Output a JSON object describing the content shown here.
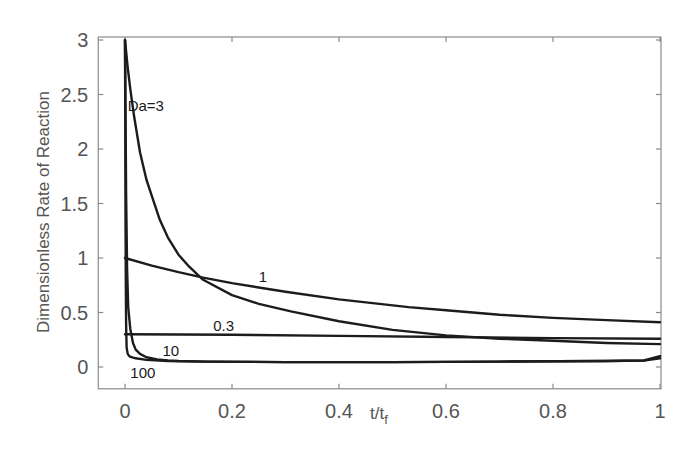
{
  "chart_data": {
    "type": "line",
    "title": "",
    "xlabel": "t/t_f",
    "xlabel_main": "t/t",
    "xlabel_sub": "f",
    "ylabel": "Dimensionless Rate of Reaction",
    "xlim": [
      -0.05,
      1
    ],
    "ylim": [
      -0.2,
      3
    ],
    "grid": false,
    "legend": "none (inline curve labels)",
    "xticks": [
      0,
      0.2,
      0.4,
      0.6,
      0.8,
      1
    ],
    "xtick_labels": [
      "0",
      "0.2",
      "0.4",
      "0.6",
      "0.8",
      "1"
    ],
    "yticks": [
      0,
      0.5,
      1,
      1.5,
      2,
      2.5,
      3
    ],
    "ytick_labels": [
      "0",
      "0.5",
      "1",
      "1.5",
      "2",
      "2.5",
      "3"
    ],
    "series": [
      {
        "name": "Da=3",
        "label": "Da=3",
        "label_pos": [
          0.005,
          2.35
        ],
        "x": [
          0,
          0.005,
          0.01,
          0.017,
          0.028,
          0.04,
          0.05,
          0.065,
          0.08,
          0.1,
          0.12,
          0.146,
          0.2,
          0.25,
          0.31,
          0.4,
          0.5,
          0.6,
          0.7,
          0.8,
          0.9,
          1.0
        ],
        "y": [
          3.0,
          2.75,
          2.55,
          2.3,
          1.97,
          1.72,
          1.57,
          1.35,
          1.19,
          1.03,
          0.92,
          0.8,
          0.66,
          0.58,
          0.51,
          0.42,
          0.34,
          0.29,
          0.26,
          0.24,
          0.22,
          0.21
        ]
      },
      {
        "name": "Da=1",
        "label": "1",
        "label_pos": [
          0.25,
          0.78
        ],
        "x": [
          0,
          0.05,
          0.1,
          0.146,
          0.2,
          0.3,
          0.4,
          0.53,
          0.6,
          0.7,
          0.8,
          0.9,
          1.0
        ],
        "y": [
          1.0,
          0.93,
          0.87,
          0.82,
          0.77,
          0.69,
          0.62,
          0.55,
          0.52,
          0.48,
          0.45,
          0.43,
          0.41
        ]
      },
      {
        "name": "Da=0.3",
        "label": "0.3",
        "label_pos": [
          0.165,
          0.33
        ],
        "x": [
          0,
          0.2,
          0.4,
          0.6,
          0.8,
          1.0
        ],
        "y": [
          0.3,
          0.295,
          0.285,
          0.275,
          0.265,
          0.26
        ]
      },
      {
        "name": "Da=10",
        "label": "10",
        "label_pos": [
          0.07,
          0.1
        ],
        "x": [
          0,
          0.002,
          0.004,
          0.006,
          0.01,
          0.015,
          0.02,
          0.028,
          0.04,
          0.06,
          0.08,
          0.1,
          0.15,
          0.3,
          0.5,
          0.7,
          0.9,
          0.97,
          1.0
        ],
        "y": [
          3.0,
          1.6,
          0.9,
          0.55,
          0.35,
          0.22,
          0.16,
          0.12,
          0.09,
          0.07,
          0.06,
          0.055,
          0.05,
          0.045,
          0.045,
          0.05,
          0.055,
          0.06,
          0.08
        ]
      },
      {
        "name": "Da=100",
        "label": "100",
        "label_pos": [
          0.01,
          -0.1
        ],
        "x": [
          0,
          0.0005,
          0.001,
          0.0015,
          0.002,
          0.003,
          0.005,
          0.008,
          0.012,
          0.02,
          0.04,
          0.08,
          0.15,
          0.3,
          0.5,
          0.7,
          0.9,
          0.97,
          1.0
        ],
        "y": [
          3.0,
          2.2,
          1.4,
          0.8,
          0.4,
          0.18,
          0.12,
          0.1,
          0.09,
          0.08,
          0.065,
          0.055,
          0.05,
          0.045,
          0.045,
          0.05,
          0.055,
          0.06,
          0.1
        ]
      }
    ]
  },
  "colors": {
    "curve": "#1c1c1c",
    "axis": "#8a8a8a",
    "text": "#555555",
    "background": "#ffffff"
  }
}
